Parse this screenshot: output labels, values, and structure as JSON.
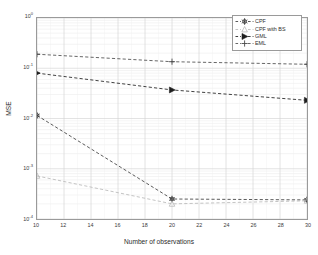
{
  "chart_data": {
    "type": "line",
    "title": "",
    "xlabel": "Number of observations",
    "ylabel": "MSE",
    "xscale": "linear",
    "yscale": "log",
    "xlim": [
      10,
      30
    ],
    "ylim": [
      0.0001,
      1
    ],
    "grid": true,
    "legend_position": "upper right",
    "xticks": [
      "10",
      "12",
      "14",
      "16",
      "18",
      "20",
      "22",
      "24",
      "26",
      "28",
      "30"
    ],
    "yticks": [
      "10^0",
      "10^-1",
      "10^-2",
      "10^-3",
      "10^-4"
    ],
    "ytick_labels": [
      {
        "base": "10",
        "exp": "0"
      },
      {
        "base": "10",
        "exp": "-1"
      },
      {
        "base": "10",
        "exp": "-2"
      },
      {
        "base": "10",
        "exp": "-3"
      },
      {
        "base": "10",
        "exp": "-4"
      }
    ],
    "x": [
      10,
      20,
      30
    ],
    "series": [
      {
        "name": "CPF",
        "marker": "asterisk-circle",
        "linestyle": "dashed",
        "color": "#3c3c3c",
        "values": [
          0.0115,
          0.00025,
          0.00024
        ]
      },
      {
        "name": "CPF with BS",
        "marker": "triangle-up",
        "linestyle": "dashed",
        "color": "#b9b9b9",
        "values": [
          0.00072,
          0.0002,
          0.00023
        ]
      },
      {
        "name": "GML",
        "marker": "triangle-right",
        "linestyle": "dashed",
        "color": "#1e1e1e",
        "values": [
          0.08,
          0.037,
          0.023
        ]
      },
      {
        "name": "EML",
        "marker": "plus",
        "linestyle": "dashed",
        "color": "#4a4a4a",
        "values": [
          0.19,
          0.135,
          0.12
        ]
      }
    ]
  },
  "legend": {
    "entries": [
      {
        "label": "CPF"
      },
      {
        "label": "CPF with BS"
      },
      {
        "label": "GML"
      },
      {
        "label": "EML"
      }
    ]
  },
  "axes": {
    "x_title": "Number of observations",
    "y_title": "MSE"
  }
}
